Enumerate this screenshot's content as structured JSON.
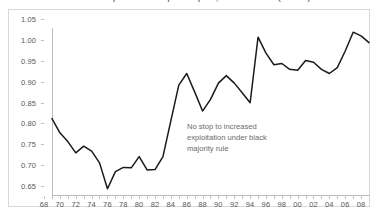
{
  "figure": {
    "title_clipped": "Platinum production per capita, 1968-2008 (index)",
    "annotation_lines": [
      "No stop to increased",
      "exploitation under black",
      "majority rule"
    ]
  },
  "chart_data": {
    "type": "line",
    "title": "",
    "xlabel": "",
    "ylabel": "",
    "xlim": [
      1968,
      2008
    ],
    "ylim": [
      0.65,
      1.05
    ],
    "grid": false,
    "legend": "none",
    "line_color": "#1a1a1a",
    "y_tick_labels": [
      "0.65",
      "0.70",
      "0.75",
      "0.80",
      "0.85",
      "0.90",
      "0.95",
      "1.00",
      "1.05"
    ],
    "y_tick_values": [
      0.65,
      0.7,
      0.75,
      0.8,
      0.85,
      0.9,
      0.95,
      1.0,
      1.05
    ],
    "x_tick_labels": [
      "68",
      "70",
      "72",
      "74",
      "76",
      "78",
      "80",
      "82",
      "84",
      "86",
      "88",
      "90",
      "92",
      "94",
      "96",
      "98",
      "00",
      "02",
      "04",
      "06",
      "08"
    ],
    "x_tick_values": [
      1968,
      1970,
      1972,
      1974,
      1976,
      1978,
      1980,
      1982,
      1984,
      1986,
      1988,
      1990,
      1992,
      1994,
      1996,
      1998,
      2000,
      2002,
      2004,
      2006,
      2008
    ],
    "x": [
      1968,
      1969,
      1970,
      1971,
      1972,
      1973,
      1974,
      1975,
      1976,
      1977,
      1978,
      1979,
      1980,
      1981,
      1982,
      1983,
      1984,
      1985,
      1986,
      1987,
      1988,
      1989,
      1990,
      1991,
      1992,
      1993,
      1994,
      1995,
      1996,
      1997,
      1998,
      1999,
      2000,
      2001,
      2002,
      2003,
      2004,
      2005,
      2006,
      2007,
      2008
    ],
    "values": [
      0.833,
      0.799,
      0.778,
      0.751,
      0.767,
      0.755,
      0.727,
      0.665,
      0.706,
      0.716,
      0.715,
      0.742,
      0.71,
      0.711,
      0.742,
      0.828,
      0.913,
      0.941,
      0.897,
      0.851,
      0.879,
      0.918,
      0.936,
      0.918,
      0.895,
      0.871,
      1.028,
      0.99,
      0.962,
      0.965,
      0.951,
      0.949,
      0.972,
      0.968,
      0.951,
      0.941,
      0.955,
      0.995,
      1.04,
      1.031,
      1.015
    ],
    "annotations": [
      {
        "text": "No stop to increased exploitation under black majority rule",
        "x": 1986,
        "y": 0.815
      }
    ]
  }
}
